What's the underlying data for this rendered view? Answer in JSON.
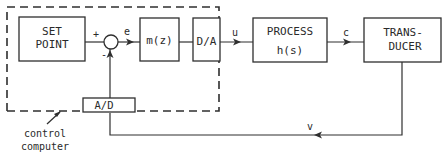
{
  "diagram": {
    "type": "block-diagram",
    "title": "",
    "blocks": [
      {
        "id": "setpoint",
        "lines": [
          "SET",
          "POINT"
        ]
      },
      {
        "id": "controller",
        "lines": [
          "m(z)"
        ]
      },
      {
        "id": "dac",
        "lines": [
          "D/A"
        ]
      },
      {
        "id": "process",
        "lines": [
          "PROCESS",
          "h(s)"
        ]
      },
      {
        "id": "transducer",
        "lines": [
          "TRANS-",
          "DUCER"
        ]
      },
      {
        "id": "adc",
        "lines": [
          "A/D"
        ]
      }
    ],
    "summing_junction": {
      "plus_sign": "+",
      "minus_sign": "-"
    },
    "signals": {
      "error": "e",
      "control": "u",
      "output": "c",
      "measured": "v"
    },
    "boundary": {
      "label_lines": [
        "control",
        "computer"
      ],
      "style": "dashed"
    },
    "connections": [
      {
        "from": "setpoint",
        "to": "summing_junction",
        "sign": "+"
      },
      {
        "from": "summing_junction",
        "to": "controller",
        "signal": "e"
      },
      {
        "from": "controller",
        "to": "dac"
      },
      {
        "from": "dac",
        "to": "process",
        "signal": "u"
      },
      {
        "from": "process",
        "to": "transducer",
        "signal": "c"
      },
      {
        "from": "transducer",
        "to": "adc",
        "signal": "v"
      },
      {
        "from": "adc",
        "to": "summing_junction",
        "sign": "-"
      }
    ]
  }
}
